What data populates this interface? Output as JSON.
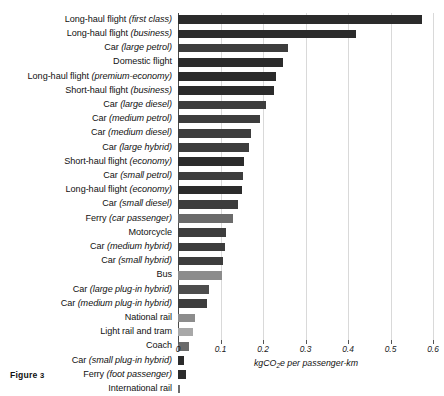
{
  "figure": {
    "caption_prefix": "Figure",
    "caption_number": "3"
  },
  "axis": {
    "xlabel_prefix": "kgCO",
    "xlabel_sub": "2",
    "xlabel_suffix": "e per passenger-km",
    "xlabel_full": "kgCO2e per passenger-km",
    "ticks": [
      "0",
      "0.1",
      "0.2",
      "0.3",
      "0.4",
      "0.5",
      "0.6"
    ],
    "tick_values": [
      0,
      0.1,
      0.2,
      0.3,
      0.4,
      0.5,
      0.6
    ]
  },
  "colors": {
    "bar_dark": "#2b2b2b",
    "bar_mid_dark": "#3d3d3d",
    "bar_mid": "#4d4d4d",
    "bar_grey": "#6b6b6b",
    "bar_light": "#8c8c8c",
    "bar_lighter": "#a8a8a8",
    "grid": "#d9d9d9",
    "axis": "#4a4a4a",
    "text": "#111111",
    "background": "#ffffff"
  },
  "chart_data": {
    "type": "bar",
    "orientation": "horizontal",
    "title": "",
    "xlabel": "kgCO2e per passenger-km",
    "ylabel": "",
    "xlim": [
      0,
      0.6
    ],
    "grid": true,
    "legend": "none",
    "categories": [
      "Long-haul flight (first class)",
      "Long-haul flight (business)",
      "Car (large petrol)",
      "Domestic flight",
      "Long-haul flight (premium-economy)",
      "Short-haul flight (business)",
      "Car (large diesel)",
      "Car (medium petrol)",
      "Car (medium diesel)",
      "Car (large hybrid)",
      "Short-haul flight (economy)",
      "Car (small petrol)",
      "Long-haul flight (economy)",
      "Car (small diesel)",
      "Ferry (car passenger)",
      "Motorcycle",
      "Car (medium hybrid)",
      "Car (small hybrid)",
      "Bus",
      "Car (large plug-in hybrid)",
      "Car (medium plug-in hybrid)",
      "National rail",
      "Light rail and tram",
      "Coach",
      "Car (small plug-in hybrid)",
      "Ferry (foot passenger)",
      "International rail"
    ],
    "labels_html": [
      {
        "plain": "Long-haul flight ",
        "italic": "(first class)"
      },
      {
        "plain": "Long-haul flight ",
        "italic": "(business)"
      },
      {
        "plain": "Car ",
        "italic": "(large petrol)"
      },
      {
        "plain": "Domestic flight",
        "italic": ""
      },
      {
        "plain": "Long-haul flight ",
        "italic": "(premium-economy)"
      },
      {
        "plain": "Short-haul flight ",
        "italic": "(business)"
      },
      {
        "plain": "Car ",
        "italic": "(large diesel)"
      },
      {
        "plain": "Car ",
        "italic": "(medium petrol)"
      },
      {
        "plain": "Car ",
        "italic": "(medium diesel)"
      },
      {
        "plain": "Car ",
        "italic": "(large hybrid)"
      },
      {
        "plain": "Short-haul flight ",
        "italic": "(economy)"
      },
      {
        "plain": "Car ",
        "italic": "(small petrol)"
      },
      {
        "plain": "Long-haul flight ",
        "italic": "(economy)"
      },
      {
        "plain": "Car ",
        "italic": "(small diesel)"
      },
      {
        "plain": "Ferry ",
        "italic": "(car passenger)"
      },
      {
        "plain": "Motorcycle",
        "italic": ""
      },
      {
        "plain": "Car ",
        "italic": "(medium hybrid)"
      },
      {
        "plain": "Car ",
        "italic": "(small hybrid)"
      },
      {
        "plain": "Bus",
        "italic": ""
      },
      {
        "plain": "Car ",
        "italic": "(large plug-in hybrid)"
      },
      {
        "plain": "Car ",
        "italic": "(medium plug-in hybrid)"
      },
      {
        "plain": "National rail",
        "italic": ""
      },
      {
        "plain": "Light rail and tram",
        "italic": ""
      },
      {
        "plain": "Coach",
        "italic": ""
      },
      {
        "plain": "Car ",
        "italic": "(small plug-in hybrid)"
      },
      {
        "plain": "Ferry ",
        "italic": "(foot passenger)"
      },
      {
        "plain": "International rail",
        "italic": ""
      }
    ],
    "values": [
      0.575,
      0.418,
      0.259,
      0.246,
      0.231,
      0.226,
      0.208,
      0.192,
      0.171,
      0.168,
      0.155,
      0.154,
      0.15,
      0.142,
      0.129,
      0.114,
      0.11,
      0.106,
      0.103,
      0.073,
      0.069,
      0.041,
      0.035,
      0.027,
      0.015,
      0.019,
      0.005
    ],
    "bar_colors": [
      "#2b2b2b",
      "#2b2b2b",
      "#3d3d3d",
      "#2b2b2b",
      "#2b2b2b",
      "#2b2b2b",
      "#3d3d3d",
      "#3d3d3d",
      "#3d3d3d",
      "#3d3d3d",
      "#2b2b2b",
      "#3d3d3d",
      "#2b2b2b",
      "#3d3d3d",
      "#6b6b6b",
      "#3d3d3d",
      "#3d3d3d",
      "#3d3d3d",
      "#8c8c8c",
      "#4d4d4d",
      "#3d3d3d",
      "#8c8c8c",
      "#a8a8a8",
      "#6b6b6b",
      "#2b2b2b",
      "#2b2b2b",
      "#6b6b6b"
    ]
  }
}
